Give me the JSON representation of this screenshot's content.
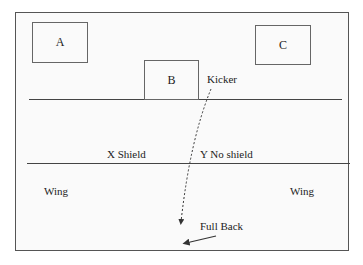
{
  "diagram": {
    "boxes": [
      {
        "id": "A",
        "label": "A"
      },
      {
        "id": "B",
        "label": "B"
      },
      {
        "id": "C",
        "label": "C"
      }
    ],
    "labels": {
      "kicker": "Kicker",
      "x_shield": "X Shield",
      "y_no_shield": "Y No shield",
      "wing_left": "Wing",
      "wing_right": "Wing",
      "full_back": "Full Back"
    },
    "colors": {
      "line": "#444444",
      "frame": "#555555",
      "background": "#fafafa"
    }
  }
}
